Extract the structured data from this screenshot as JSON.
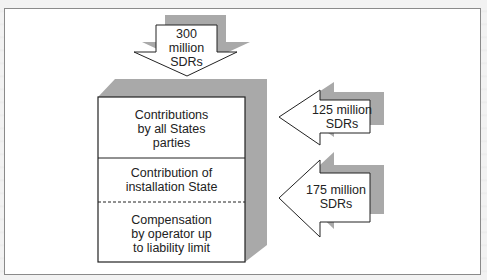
{
  "diagram": {
    "type": "liability-compensation-tiers",
    "colors": {
      "frame_border": "#8a8a8a",
      "fill": "#ffffff",
      "shadow": "#a9a9a9",
      "stroke": "#222222"
    },
    "top_arrow": {
      "amount_line1": "300",
      "amount_line2": "million",
      "amount_line3": "SDRs"
    },
    "stack_box": {
      "tiers": [
        {
          "line1": "Contributions",
          "line2": "by all States",
          "line3": "parties",
          "divider_below": "solid"
        },
        {
          "line1": "Contribution of",
          "line2": "installation State",
          "divider_below": "dashed"
        },
        {
          "line1": "Compensation",
          "line2": "by operator up",
          "line3": "to liability limit"
        }
      ]
    },
    "side_arrows": [
      {
        "line1": "125 million",
        "line2": "SDRs",
        "points_to_tier": 0
      },
      {
        "line1": "175 million",
        "line2": "SDRs",
        "points_to_tier": 1
      }
    ]
  }
}
